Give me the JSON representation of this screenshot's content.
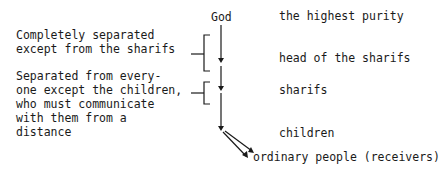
{
  "diagram": {
    "nodes": {
      "god": "God",
      "highest_purity": "the highest purity",
      "head_of_sharifs": "head of the sharifs",
      "sharifs": "sharifs",
      "children": "children",
      "ordinary_people": "ordinary people (receivers)"
    },
    "annotations": {
      "first": [
        "Completely separated",
        "except from the sharifs"
      ],
      "second": [
        "Separated from every-",
        "one except the children,",
        "who must communicate",
        "with them from a",
        "distance"
      ]
    }
  }
}
